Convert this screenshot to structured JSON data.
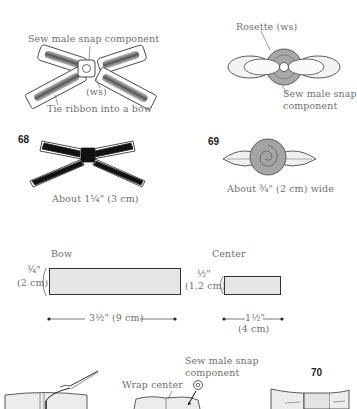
{
  "step_top_left": {
    "label_snap": "Sew male snap component",
    "label_ws": "(ws)",
    "label_tie": "Tie ribbon into a bow"
  },
  "step_top_right": {
    "label_rosette": "Rosette (ws)",
    "label_snap_line1": "Sew male snap",
    "label_snap_line2": "component"
  },
  "figure_68": {
    "number": "68",
    "caption": "About 1¼\" (3 cm)"
  },
  "figure_69": {
    "number": "69",
    "caption": "About ¾\" (2 cm) wide"
  },
  "pattern_bow": {
    "title": "Bow",
    "height_in": "¾\"",
    "height_cm": "(2 cm)",
    "width_label": "3½\" (9 cm)",
    "fill_color": "#e6e6e6"
  },
  "pattern_center": {
    "title": "Center",
    "height_in": "½\"",
    "height_cm": "(1.2 cm)",
    "width_in": "1½\"",
    "width_cm": "(4 cm)",
    "fill_color": "#e6e6e6"
  },
  "step_bottom": {
    "label_wrap": "Wrap center",
    "label_snap_line1": "Sew male snap",
    "label_snap_line2": "component",
    "figure_number": "70"
  }
}
